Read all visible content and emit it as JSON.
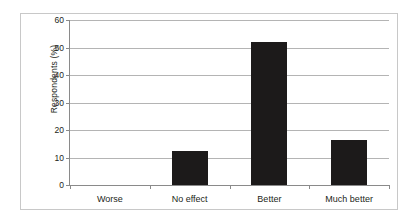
{
  "chart_data": {
    "type": "bar",
    "title": "",
    "subtitle": "",
    "xlabel": "",
    "ylabel": "Respondents (%)",
    "categories": [
      "Worse",
      "No effect",
      "Better",
      "Much better"
    ],
    "values": [
      0,
      12.5,
      52,
      16.5
    ],
    "ylim": [
      0,
      60
    ],
    "ytick_values": [
      0,
      10,
      20,
      30,
      40,
      50,
      60
    ],
    "ytick_labels": [
      "0",
      "10",
      "20",
      "30",
      "40",
      "50",
      "60"
    ],
    "grid": "horizontal",
    "legend": "none",
    "bar_color": "#1c1a1a",
    "gridline_color": "#b4b4b4",
    "axis_color": "#8a8a8a",
    "border_color": "#c8c8c8",
    "background_color": "#ffffff",
    "text_color": "#231f20"
  }
}
